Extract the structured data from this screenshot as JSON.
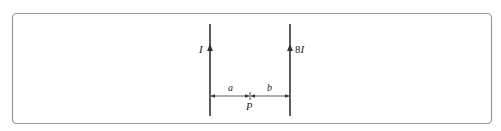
{
  "diagram": {
    "type": "two-parallel-current-wires",
    "left_wire": {
      "current_label": "I",
      "direction": "up"
    },
    "right_wire": {
      "current_prefix": "8",
      "current_symbol": "I",
      "direction": "up"
    },
    "point": {
      "label": "P"
    },
    "distances": {
      "left_to_point": "a",
      "point_to_right": "b"
    },
    "colors": {
      "frame": "#9a9a9a",
      "wire": "#333333",
      "text": "#222222"
    }
  }
}
